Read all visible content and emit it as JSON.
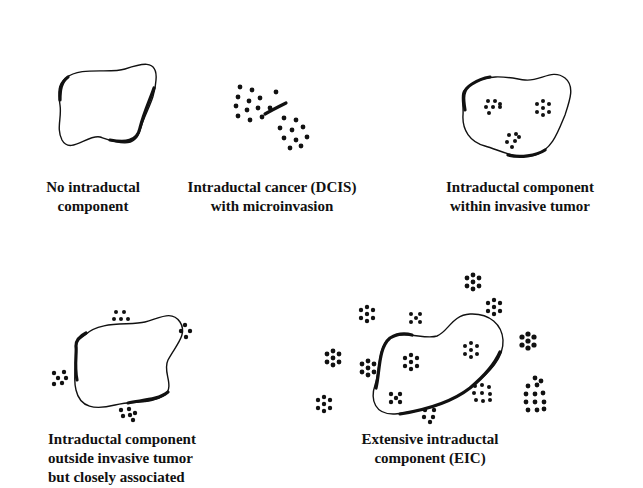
{
  "figure": {
    "panels": [
      {
        "id": "no-intraductal",
        "lines": [
          "No intraductal",
          "component"
        ]
      },
      {
        "id": "dcis-microinvasion",
        "lines": [
          "Intraductal cancer (DCIS)",
          "with microinvasion"
        ]
      },
      {
        "id": "within-invasive",
        "lines": [
          "Intraductal component",
          "within invasive tumor"
        ]
      },
      {
        "id": "outside-invasive",
        "lines": [
          "Intraductal component",
          "outside invasive tumor",
          "but closely associated"
        ]
      },
      {
        "id": "eic",
        "lines": [
          "Extensive intraductal",
          "component (EIC)"
        ]
      }
    ]
  }
}
